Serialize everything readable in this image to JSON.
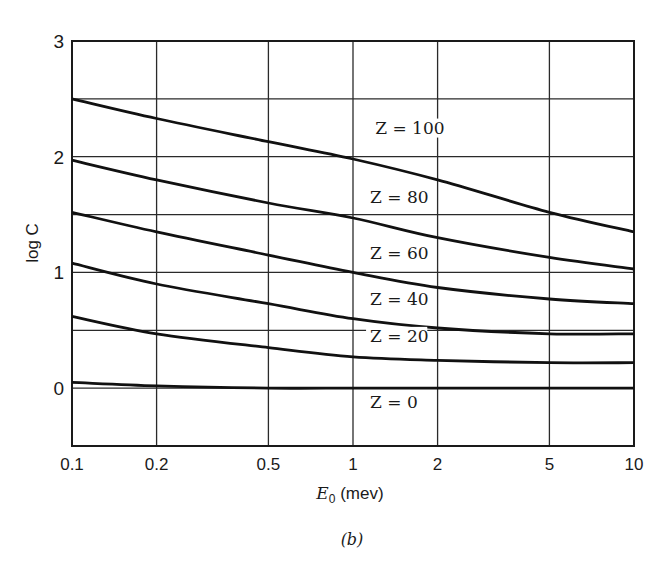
{
  "chart_data": {
    "type": "line",
    "title": "",
    "caption": "(b)",
    "xlabel": "E0 (mev)",
    "xlabel_main": "E",
    "xlabel_sub": "0",
    "xlabel_unit": " (mev)",
    "ylabel": "log C",
    "xscale": "log",
    "xlim": [
      0.1,
      10
    ],
    "ylim": [
      -0.5,
      3
    ],
    "grid": true,
    "legend": "inline labels",
    "x_ticks": [
      0.1,
      0.2,
      0.5,
      1,
      2,
      5,
      10
    ],
    "x_tick_labels": [
      "0.1",
      "0.2",
      "0.5",
      "1",
      "2",
      "5",
      "10"
    ],
    "y_ticks": [
      0,
      1,
      2,
      3
    ],
    "y_tick_labels": [
      "0",
      "1",
      "2",
      "3"
    ],
    "y_gridlines": [
      -0.5,
      0,
      0.5,
      1,
      1.5,
      2,
      2.5,
      3
    ],
    "x": [
      0.1,
      0.2,
      0.5,
      1,
      2,
      5,
      10
    ],
    "series": [
      {
        "name": "Z = 100",
        "values": [
          2.5,
          2.33,
          2.13,
          1.98,
          1.8,
          1.52,
          1.35
        ]
      },
      {
        "name": "Z = 80",
        "values": [
          1.97,
          1.8,
          1.6,
          1.47,
          1.3,
          1.13,
          1.03
        ]
      },
      {
        "name": "Z = 60",
        "values": [
          1.52,
          1.35,
          1.15,
          1.0,
          0.87,
          0.77,
          0.73
        ]
      },
      {
        "name": "Z = 40",
        "values": [
          1.08,
          0.9,
          0.73,
          0.6,
          0.52,
          0.47,
          0.47
        ]
      },
      {
        "name": "Z = 20",
        "values": [
          0.62,
          0.47,
          0.35,
          0.27,
          0.24,
          0.22,
          0.22
        ]
      },
      {
        "name": "Z = 0",
        "values": [
          0.05,
          0.02,
          0.0,
          0.0,
          0.0,
          0.0,
          0.0
        ]
      }
    ],
    "annotations": [
      {
        "text": "Z = 100",
        "x": 1.2,
        "y": 2.2
      },
      {
        "text": "Z = 80",
        "x": 1.15,
        "y": 1.6
      },
      {
        "text": "Z = 60",
        "x": 1.15,
        "y": 1.12
      },
      {
        "text": "Z = 40",
        "x": 1.15,
        "y": 0.72
      },
      {
        "text": "Z = 20",
        "x": 1.15,
        "y": 0.4
      },
      {
        "text": "Z = 0",
        "x": 1.15,
        "y": -0.17
      }
    ]
  },
  "colors": {
    "ink": "#1a1a1a",
    "background": "#ffffff"
  }
}
